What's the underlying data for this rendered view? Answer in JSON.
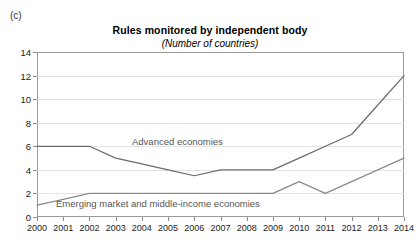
{
  "panel": {
    "label": "(c)"
  },
  "chart_data": {
    "type": "line",
    "title": "Rules monitored by independent body",
    "subtitle": "(Number of countries)",
    "xlabel": "",
    "ylabel": "",
    "ylim": [
      0,
      14
    ],
    "ytick_step": 2,
    "yticks": [
      0,
      2,
      4,
      6,
      8,
      10,
      12,
      14
    ],
    "ytick_labels": [
      "0",
      "2",
      "4",
      "6",
      "8",
      "10",
      "12",
      "14"
    ],
    "grid": true,
    "legend_position": "inline-annotation",
    "categories": [
      2000,
      2001,
      2002,
      2003,
      2004,
      2005,
      2006,
      2007,
      2008,
      2009,
      2010,
      2011,
      2012,
      2013,
      2014
    ],
    "xtick_labels": [
      "2000",
      "2001",
      "2002",
      "2003",
      "2004",
      "2005",
      "2006",
      "2007",
      "2008",
      "2009",
      "2010",
      "2011",
      "2012",
      "2013",
      "2014"
    ],
    "series": [
      {
        "name": "Advanced economies",
        "color": "#6b6b6b",
        "values": [
          6,
          6,
          6,
          5,
          4.5,
          4,
          3.5,
          4,
          4,
          4,
          5,
          6,
          7,
          9.5,
          12
        ]
      },
      {
        "name": "Emerging market and middle-income economies",
        "color": "#8a8a8a",
        "values": [
          1,
          1.5,
          2,
          2,
          2,
          2,
          2,
          2,
          2,
          2,
          3,
          2,
          3,
          4,
          5
        ]
      }
    ],
    "annotations": [
      {
        "text": "Advanced economies",
        "series": "Advanced economies"
      },
      {
        "text": "Emerging market and middle-income economies",
        "series": "Emerging market and middle-income economies"
      }
    ]
  }
}
